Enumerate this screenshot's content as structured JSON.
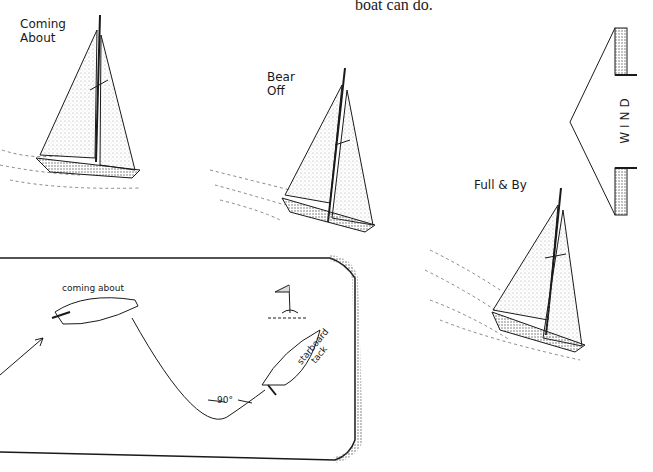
{
  "caption_fragment": "boat can do.",
  "figures": [
    {
      "label_line1": "Coming",
      "label_line2": "About"
    },
    {
      "label_line1": "Bear",
      "label_line2": "Off"
    },
    {
      "label": "Full & By"
    }
  ],
  "wind_arrow": {
    "label": "WIND"
  },
  "inset_diagram": {
    "top_label": "coming about",
    "angle_label": "90°",
    "side_label_line1": "starboard",
    "side_label_line2": "tack"
  },
  "colors": {
    "ink": "#1a1a1a",
    "stipple": "#9a9a9a",
    "background": "#ffffff"
  }
}
